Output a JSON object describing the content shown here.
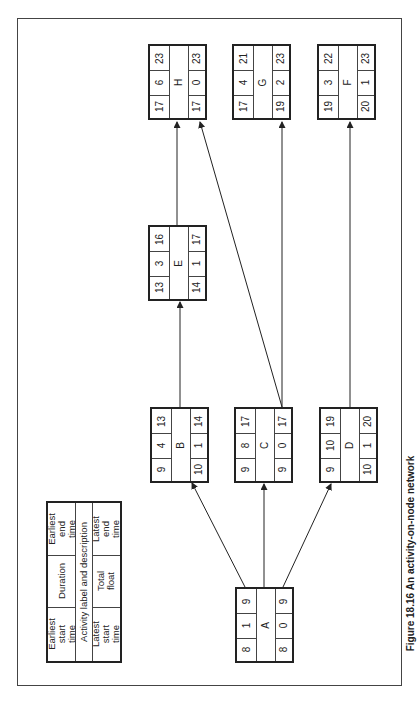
{
  "caption": {
    "figure_number": "Figure 18.16",
    "title": "An activity-on-node network"
  },
  "legend": {
    "earliest_start": "Earliest start time",
    "duration": "Duration",
    "earliest_end": "Earliest end time",
    "label_desc": "Activity label and description",
    "latest_start": "Latest start time",
    "total_float": "Total float",
    "latest_end": "Latest end time"
  },
  "nodes": {
    "A": {
      "label": "A",
      "es": "8",
      "dur": "1",
      "ef": "9",
      "ls": "8",
      "tf": "0",
      "lf": "9"
    },
    "B": {
      "label": "B",
      "es": "9",
      "dur": "4",
      "ef": "13",
      "ls": "10",
      "tf": "1",
      "lf": "14"
    },
    "C": {
      "label": "C",
      "es": "9",
      "dur": "8",
      "ef": "17",
      "ls": "9",
      "tf": "0",
      "lf": "17"
    },
    "D": {
      "label": "D",
      "es": "9",
      "dur": "10",
      "ef": "19",
      "ls": "10",
      "tf": "1",
      "lf": "20"
    },
    "E": {
      "label": "E",
      "es": "13",
      "dur": "3",
      "ef": "16",
      "ls": "14",
      "tf": "1",
      "lf": "17"
    },
    "F": {
      "label": "F",
      "es": "19",
      "dur": "3",
      "ef": "22",
      "ls": "20",
      "tf": "1",
      "lf": "23"
    },
    "G": {
      "label": "G",
      "es": "17",
      "dur": "4",
      "ef": "21",
      "ls": "19",
      "tf": "2",
      "lf": "23"
    },
    "H": {
      "label": "H",
      "es": "17",
      "dur": "6",
      "ef": "23",
      "ls": "17",
      "tf": "0",
      "lf": "23"
    }
  },
  "edges": [
    {
      "from": "A",
      "to": "B"
    },
    {
      "from": "A",
      "to": "C"
    },
    {
      "from": "A",
      "to": "D"
    },
    {
      "from": "B",
      "to": "E"
    },
    {
      "from": "E",
      "to": "H"
    },
    {
      "from": "C",
      "to": "H"
    },
    {
      "from": "C",
      "to": "G"
    },
    {
      "from": "D",
      "to": "F"
    }
  ]
}
